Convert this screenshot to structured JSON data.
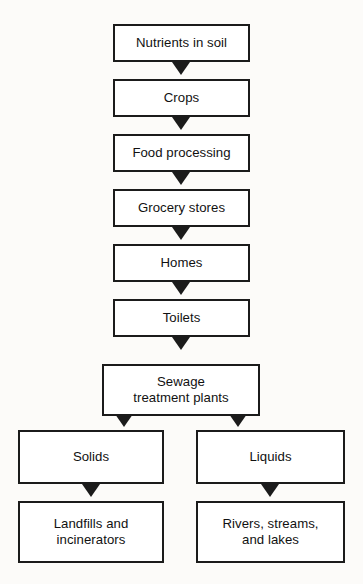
{
  "diagram": {
    "background_color": "#fcfbf9",
    "line_color": "#1b1b1b",
    "box_fill": "#ffffff",
    "nodes": [
      {
        "id": "nutrients",
        "label": "Nutrients in soil"
      },
      {
        "id": "crops",
        "label": "Crops"
      },
      {
        "id": "food",
        "label": "Food processing"
      },
      {
        "id": "grocery",
        "label": "Grocery stores"
      },
      {
        "id": "homes",
        "label": "Homes"
      },
      {
        "id": "toilets",
        "label": "Toilets"
      },
      {
        "id": "sewage_l1",
        "label": "Sewage"
      },
      {
        "id": "sewage_l2",
        "label": "treatment plants"
      },
      {
        "id": "solids",
        "label": "Solids"
      },
      {
        "id": "liquids",
        "label": "Liquids"
      },
      {
        "id": "landfills_l1",
        "label": "Landfills and"
      },
      {
        "id": "landfills_l2",
        "label": "incinerators"
      },
      {
        "id": "rivers_l1",
        "label": "Rivers, streams,"
      },
      {
        "id": "rivers_l2",
        "label": "and lakes"
      }
    ],
    "edges": [
      {
        "from": "nutrients",
        "to": "crops"
      },
      {
        "from": "crops",
        "to": "food"
      },
      {
        "from": "food",
        "to": "grocery"
      },
      {
        "from": "grocery",
        "to": "homes"
      },
      {
        "from": "homes",
        "to": "toilets"
      },
      {
        "from": "toilets",
        "to": "sewage"
      },
      {
        "from": "sewage",
        "to": "solids"
      },
      {
        "from": "sewage",
        "to": "liquids"
      },
      {
        "from": "solids",
        "to": "landfills"
      },
      {
        "from": "liquids",
        "to": "rivers"
      }
    ]
  }
}
